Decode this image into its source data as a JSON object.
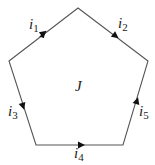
{
  "diagram": {
    "region_label": "J",
    "stroke_color": "#555555",
    "arrow_color": "#111111",
    "vertices": [
      [
        78,
        8
      ],
      [
        148,
        61
      ],
      [
        123,
        145
      ],
      [
        36,
        145
      ],
      [
        9,
        61
      ]
    ],
    "edges": [
      {
        "name": "i",
        "sub": "1",
        "direction": "up-right"
      },
      {
        "name": "i",
        "sub": "2",
        "direction": "down-right"
      },
      {
        "name": "i",
        "sub": "3",
        "direction": "down"
      },
      {
        "name": "i",
        "sub": "4",
        "direction": "right"
      },
      {
        "name": "i",
        "sub": "5",
        "direction": "up"
      }
    ]
  }
}
